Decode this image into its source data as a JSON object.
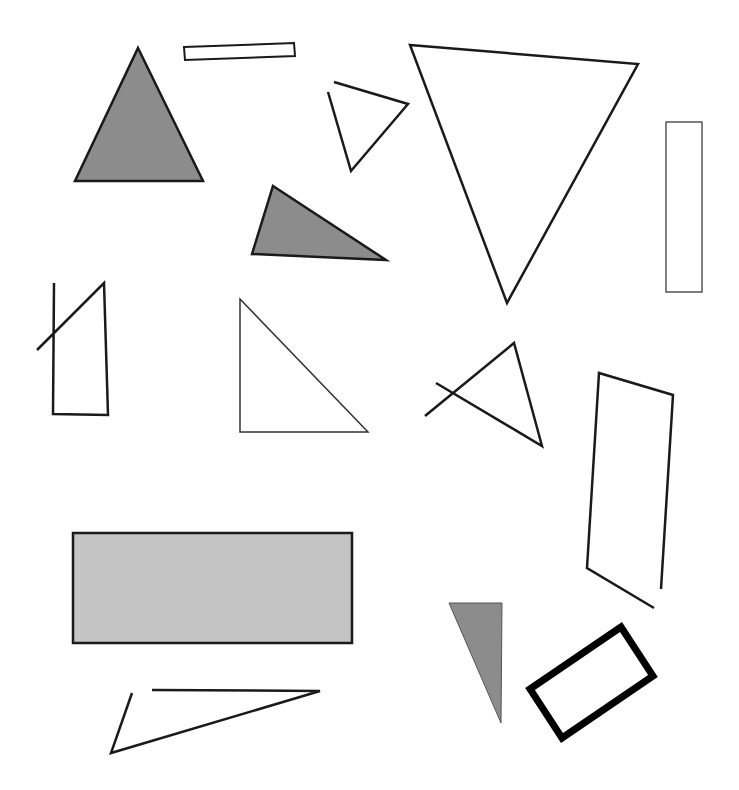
{
  "canvas": {
    "width": 739,
    "height": 790,
    "background": "#ffffff"
  },
  "colors": {
    "stroke": "#1a1a1a",
    "dark_fill": "#8c8c8c",
    "light_fill": "#c4c4c4",
    "thin_stroke": "#444444"
  },
  "shapes": [
    {
      "name": "gray-equilateral-triangle",
      "type": "polygon",
      "points": "138,48 203,181 75,181",
      "fill": "#8c8c8c",
      "stroke": "#1a1a1a",
      "width": 2.5
    },
    {
      "name": "thin-slanted-rectangle",
      "type": "polygon",
      "points": "184,47 294,43 295,56 185,60",
      "fill": "none",
      "stroke": "#1a1a1a",
      "width": 2
    },
    {
      "name": "small-open-triangle",
      "type": "polyline",
      "points": "334,82 408,104 351,171 328,92",
      "fill": "none",
      "stroke": "#1a1a1a",
      "width": 2.5
    },
    {
      "name": "large-inverted-triangle",
      "type": "polygon",
      "points": "410,45 638,64 507,303",
      "fill": "none",
      "stroke": "#1a1a1a",
      "width": 2.5
    },
    {
      "name": "tall-narrow-rectangle",
      "type": "polygon",
      "points": "666,122 702,122 702,292 666,292",
      "fill": "none",
      "stroke": "#555555",
      "width": 1.5
    },
    {
      "name": "gray-obtuse-triangle",
      "type": "polygon",
      "points": "273,186 386,260 252,254",
      "fill": "#8c8c8c",
      "stroke": "#1a1a1a",
      "width": 2.5
    },
    {
      "name": "open-quadrilateral-crossed",
      "type": "polyline",
      "points": "54,283 53,414 108,415 104,283 37,350",
      "fill": "none",
      "stroke": "#1a1a1a",
      "width": 2.5
    },
    {
      "name": "thin-right-triangle",
      "type": "polygon",
      "points": "240,299 368,432 240,432",
      "fill": "none",
      "stroke": "#333333",
      "width": 1.5
    },
    {
      "name": "crossed-open-triangle",
      "type": "polyline",
      "points": "425,416 514,343 542,446 436,383",
      "fill": "none",
      "stroke": "#1a1a1a",
      "width": 2.5
    },
    {
      "name": "open-tall-parallelogram",
      "type": "polyline",
      "points": "661,589 673,395 599,373 587,568 654,608",
      "fill": "none",
      "stroke": "#1a1a1a",
      "width": 2.5
    },
    {
      "name": "light-gray-rectangle",
      "type": "polygon",
      "points": "73,533 352,533 352,643 73,643",
      "fill": "#c4c4c4",
      "stroke": "#1a1a1a",
      "width": 2.5
    },
    {
      "name": "gray-thin-triangle",
      "type": "polygon",
      "points": "449,603 502,603 501,723",
      "fill": "#8c8c8c",
      "stroke": "#555555",
      "width": 1
    },
    {
      "name": "thick-rotated-rectangle",
      "type": "polygon",
      "points": "530,689 621,627 653,676 562,738",
      "fill": "none",
      "stroke": "#000000",
      "width": 7
    },
    {
      "name": "open-flat-triangle",
      "type": "polyline",
      "points": "152,690 320,691 111,753 132,693",
      "fill": "none",
      "stroke": "#1a1a1a",
      "width": 2.5
    }
  ]
}
